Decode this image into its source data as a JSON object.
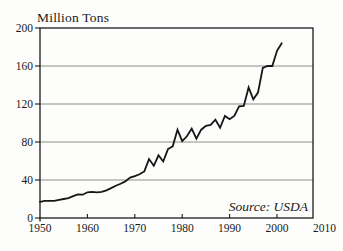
{
  "figure": {
    "y_axis_title": "Million Tons",
    "source_label": "Source: USDA"
  },
  "chart_data": {
    "type": "line",
    "title": "Million Tons",
    "xlabel": "",
    "ylabel": "Million Tons",
    "xlim": [
      1950,
      2010
    ],
    "ylim": [
      0,
      200
    ],
    "x_ticks": [
      1950,
      1960,
      1970,
      1980,
      1990,
      2000,
      2010
    ],
    "y_ticks": [
      0,
      40,
      80,
      120,
      160,
      200
    ],
    "grid": "horizontal-gridlines-at-y-ticks",
    "legend": "none",
    "annotations": [
      "Source: USDA"
    ],
    "line_color": "#161616",
    "gridline_color": "#8c8c8c",
    "frame_color": "#1c1c1c",
    "series": [
      {
        "x": [
          1950,
          1951,
          1952,
          1953,
          1954,
          1955,
          1956,
          1957,
          1958,
          1959,
          1960,
          1961,
          1962,
          1963,
          1964,
          1965,
          1966,
          1967,
          1968,
          1969,
          1970,
          1971,
          1972,
          1973,
          1974,
          1975,
          1976,
          1977,
          1978,
          1979,
          1980,
          1981,
          1982,
          1983,
          1984,
          1985,
          1986,
          1987,
          1988,
          1989,
          1990,
          1991,
          1992,
          1993,
          1994,
          1995,
          1996,
          1997,
          1998,
          1999,
          2000,
          2001
        ],
        "y": [
          17,
          18,
          18,
          18,
          19,
          20,
          21,
          23,
          25,
          24.5,
          27,
          27.5,
          27,
          27.5,
          29,
          31.5,
          34,
          36,
          38.5,
          42.5,
          44,
          46,
          49,
          62,
          55,
          66,
          59.5,
          72.5,
          75.5,
          93,
          81,
          86,
          94,
          83.5,
          93,
          97,
          98,
          103.5,
          95,
          107.5,
          104,
          107.5,
          117.5,
          118,
          137.5,
          125,
          132,
          158,
          160,
          160,
          176,
          184
        ]
      }
    ]
  }
}
